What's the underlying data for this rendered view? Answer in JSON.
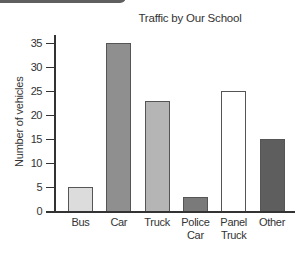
{
  "chart_data": {
    "type": "bar",
    "title": "Traffic by Our School",
    "xlabel": "",
    "ylabel": "Number of vehicles",
    "categories": [
      "Bus",
      "Car",
      "Truck",
      "Police Car",
      "Panel Truck",
      "Other"
    ],
    "category_lines": [
      [
        "Bus"
      ],
      [
        "Car"
      ],
      [
        "Truck"
      ],
      [
        "Police",
        "Car"
      ],
      [
        "Panel",
        "Truck"
      ],
      [
        "Other"
      ]
    ],
    "values": [
      5,
      35,
      23,
      3,
      25,
      15
    ],
    "bar_colors": [
      "#dcdcdc",
      "#8f8f8f",
      "#b5b5b5",
      "#7a7a7a",
      "#ffffff",
      "#5e5e5e"
    ],
    "ylim": [
      0,
      35
    ],
    "yticks": [
      0,
      5,
      10,
      15,
      20,
      25,
      30,
      35
    ],
    "grid": false,
    "legend": null
  }
}
